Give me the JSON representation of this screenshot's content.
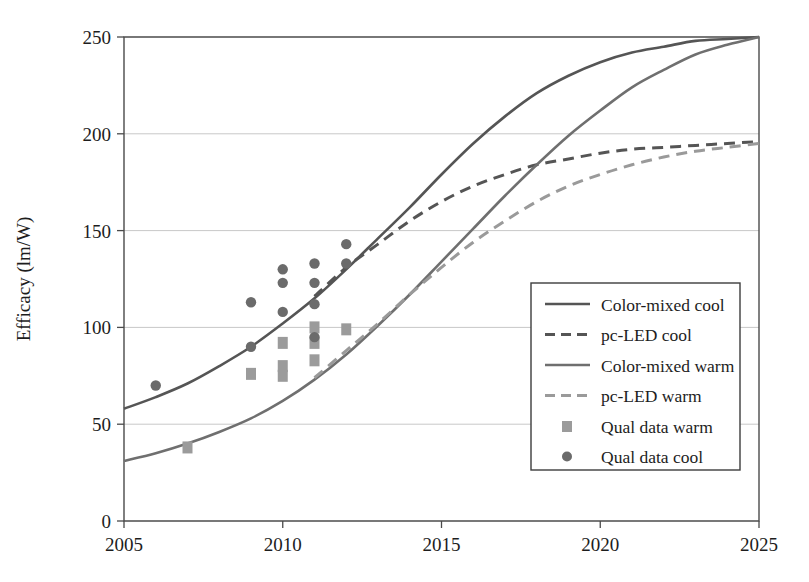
{
  "chart_data": {
    "type": "line",
    "title": "",
    "xlabel": "",
    "ylabel": "Efficacy (lm/W)",
    "xlim": [
      2005,
      2025
    ],
    "ylim": [
      0,
      250
    ],
    "xticks": [
      2005,
      2010,
      2015,
      2020,
      2025
    ],
    "yticks": [
      0,
      50,
      100,
      150,
      200,
      250
    ],
    "xtick_labels": [
      "2005",
      "2010",
      "2015",
      "2020",
      "2025"
    ],
    "ytick_labels": [
      "0",
      "50",
      "100",
      "150",
      "200",
      "250"
    ],
    "grid": "horizontal",
    "legend_position": "center-right",
    "colors": {
      "color_mixed_cool": "#555555",
      "pc_led_cool": "#555555",
      "color_mixed_warm": "#6f6f6f",
      "pc_led_warm": "#9a9a9a",
      "qual_data_warm": "#9b9b9b",
      "qual_data_cool": "#6b6b6b",
      "axis": "#4a4a4a",
      "grid": "#c8c8c8",
      "background": "#ffffff"
    },
    "series": [
      {
        "name": "Color-mixed cool",
        "style": "solid",
        "color": "#555555",
        "points": [
          [
            2005,
            58
          ],
          [
            2006,
            64
          ],
          [
            2007,
            71
          ],
          [
            2008,
            80
          ],
          [
            2009,
            90
          ],
          [
            2010,
            102
          ],
          [
            2011,
            115
          ],
          [
            2012,
            130
          ],
          [
            2013,
            146
          ],
          [
            2014,
            162
          ],
          [
            2015,
            179
          ],
          [
            2016,
            195
          ],
          [
            2017,
            209
          ],
          [
            2018,
            221
          ],
          [
            2019,
            230
          ],
          [
            2020,
            237
          ],
          [
            2021,
            242
          ],
          [
            2022,
            245
          ],
          [
            2023,
            248
          ],
          [
            2024,
            249
          ],
          [
            2025,
            250
          ]
        ]
      },
      {
        "name": "pc-LED cool",
        "style": "dashed",
        "color": "#555555",
        "points": [
          [
            2011,
            116
          ],
          [
            2012,
            131
          ],
          [
            2013,
            143
          ],
          [
            2014,
            155
          ],
          [
            2015,
            165
          ],
          [
            2016,
            173
          ],
          [
            2017,
            179
          ],
          [
            2018,
            184
          ],
          [
            2019,
            187
          ],
          [
            2020,
            190
          ],
          [
            2021,
            192
          ],
          [
            2022,
            193
          ],
          [
            2023,
            194
          ],
          [
            2024,
            195
          ],
          [
            2025,
            196
          ]
        ]
      },
      {
        "name": "Color-mixed warm",
        "style": "solid",
        "color": "#6f6f6f",
        "points": [
          [
            2005,
            31
          ],
          [
            2006,
            35
          ],
          [
            2007,
            40
          ],
          [
            2008,
            46
          ],
          [
            2009,
            53
          ],
          [
            2010,
            62
          ],
          [
            2011,
            73
          ],
          [
            2012,
            86
          ],
          [
            2013,
            101
          ],
          [
            2014,
            117
          ],
          [
            2015,
            134
          ],
          [
            2016,
            151
          ],
          [
            2017,
            168
          ],
          [
            2018,
            184
          ],
          [
            2019,
            199
          ],
          [
            2020,
            212
          ],
          [
            2021,
            224
          ],
          [
            2022,
            233
          ],
          [
            2023,
            241
          ],
          [
            2024,
            246
          ],
          [
            2025,
            250
          ]
        ]
      },
      {
        "name": "pc-LED warm",
        "style": "dashed",
        "color": "#9a9a9a",
        "points": [
          [
            2011,
            74
          ],
          [
            2012,
            88
          ],
          [
            2013,
            102
          ],
          [
            2014,
            117
          ],
          [
            2015,
            131
          ],
          [
            2016,
            144
          ],
          [
            2017,
            155
          ],
          [
            2018,
            165
          ],
          [
            2019,
            173
          ],
          [
            2020,
            179
          ],
          [
            2021,
            184
          ],
          [
            2022,
            188
          ],
          [
            2023,
            191
          ],
          [
            2024,
            193
          ],
          [
            2025,
            195
          ]
        ]
      }
    ],
    "scatter": [
      {
        "name": "Qual data warm",
        "marker": "square",
        "color": "#9b9b9b",
        "points": [
          [
            2007,
            38
          ],
          [
            2009,
            76
          ],
          [
            2010,
            92
          ],
          [
            2010,
            80
          ],
          [
            2010,
            75
          ],
          [
            2011,
            100
          ],
          [
            2011,
            92
          ],
          [
            2011,
            83
          ],
          [
            2012,
            99
          ]
        ]
      },
      {
        "name": "Qual data cool",
        "marker": "circle",
        "color": "#6b6b6b",
        "points": [
          [
            2006,
            70
          ],
          [
            2009,
            113
          ],
          [
            2009,
            90
          ],
          [
            2010,
            130
          ],
          [
            2010,
            123
          ],
          [
            2010,
            108
          ],
          [
            2011,
            133
          ],
          [
            2011,
            123
          ],
          [
            2011,
            112
          ],
          [
            2011,
            95
          ],
          [
            2012,
            143
          ],
          [
            2012,
            133
          ]
        ]
      }
    ],
    "legend_entries": [
      {
        "label": "Color-mixed cool",
        "type": "line",
        "style": "solid",
        "color": "#555555"
      },
      {
        "label": "pc-LED cool",
        "type": "line",
        "style": "dashed",
        "color": "#555555"
      },
      {
        "label": "Color-mixed warm",
        "type": "line",
        "style": "solid",
        "color": "#6f6f6f"
      },
      {
        "label": "pc-LED warm",
        "type": "line",
        "style": "dashed",
        "color": "#9a9a9a"
      },
      {
        "label": "Qual data warm",
        "type": "marker",
        "style": "square",
        "color": "#9b9b9b"
      },
      {
        "label": "Qual data cool",
        "type": "marker",
        "style": "circle",
        "color": "#6b6b6b"
      }
    ]
  }
}
